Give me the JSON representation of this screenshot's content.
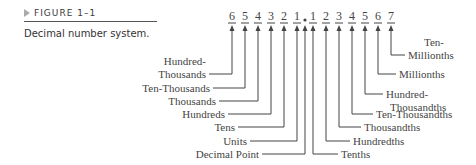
{
  "figure": {
    "label": "FIGURE 1–1",
    "title": "Decimal number system."
  },
  "diagram": {
    "digits_left": [
      "6",
      "5",
      "4",
      "3",
      "2",
      "1"
    ],
    "digits_right": [
      "1",
      "2",
      "3",
      "4",
      "5",
      "6",
      "7"
    ],
    "labels_left": [
      {
        "lines": [
          "Hundred-",
          "Thousands"
        ]
      },
      {
        "lines": [
          "Ten-Thousands"
        ]
      },
      {
        "lines": [
          "Thousands"
        ]
      },
      {
        "lines": [
          "Hundreds"
        ]
      },
      {
        "lines": [
          "Tens"
        ]
      },
      {
        "lines": [
          "Units"
        ]
      },
      {
        "lines": [
          "Decimal Point"
        ]
      }
    ],
    "labels_right": [
      {
        "lines": [
          "Tenths"
        ]
      },
      {
        "lines": [
          "Hundredths"
        ]
      },
      {
        "lines": [
          "Thousandths"
        ]
      },
      {
        "lines": [
          "Ten-Thousandths"
        ]
      },
      {
        "lines": [
          "Hundred-",
          "Thousandths"
        ]
      },
      {
        "lines": [
          "Millionths"
        ]
      },
      {
        "lines": [
          "Ten-",
          "Millionths"
        ]
      }
    ],
    "line_color": "#444444",
    "text_color": "#444444"
  }
}
